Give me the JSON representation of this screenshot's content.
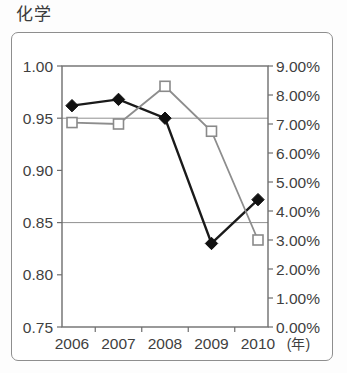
{
  "chart_data": {
    "type": "line",
    "title": "化学",
    "xlabel": "(年)",
    "ylabel": "",
    "categories": [
      "2006",
      "2007",
      "2008",
      "2009",
      "2010"
    ],
    "grid": true,
    "legend_position": "none",
    "left_axis": {
      "min": 0.75,
      "max": 1.0,
      "step": 0.05,
      "tick_labels": [
        "1.00",
        "0.95",
        "0.90",
        "0.85",
        "0.80",
        "0.75"
      ],
      "tick_values": [
        1.0,
        0.95,
        0.9,
        0.85,
        0.8,
        0.75
      ]
    },
    "right_axis": {
      "min": 0.0,
      "max": 9.0,
      "step": 1.0,
      "unit": "%",
      "tick_labels": [
        "9.00%",
        "8.00%",
        "7.00%",
        "6.00%",
        "5.00%",
        "4.00%",
        "3.00%",
        "2.00%",
        "1.00%",
        "0.00%"
      ],
      "tick_values": [
        9.0,
        8.0,
        7.0,
        6.0,
        5.0,
        4.0,
        3.0,
        2.0,
        1.0,
        0.0
      ]
    },
    "gridline_values_left": [
      0.95,
      0.85
    ],
    "series": [
      {
        "name": "series-primary",
        "axis": "left",
        "marker": "filled-diamond",
        "color": "#111111",
        "values": [
          0.962,
          0.968,
          0.95,
          0.83,
          0.872
        ]
      },
      {
        "name": "series-secondary",
        "axis": "right",
        "marker": "open-square",
        "color": "#8a8a8a",
        "values": [
          7.05,
          7.0,
          8.3,
          6.75,
          3.0
        ]
      }
    ]
  },
  "geometry": {
    "plot_left": 62,
    "plot_right": 268,
    "plot_top": 66,
    "plot_bottom": 327,
    "marker_x": [
      72,
      118.5,
      165,
      211.5,
      258
    ]
  }
}
